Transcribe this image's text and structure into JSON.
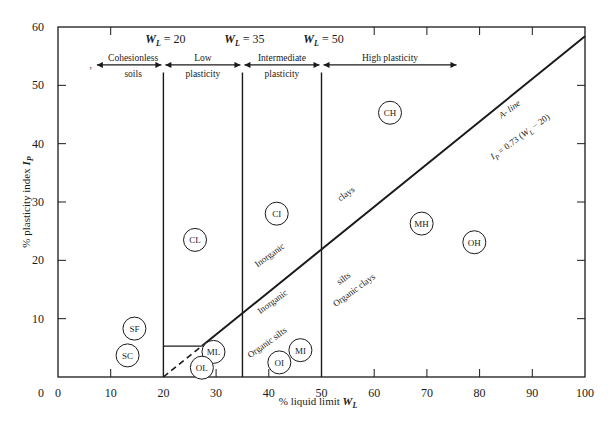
{
  "chart_data": {
    "type": "line",
    "xlabel": "% liquid limit W_L",
    "ylabel": "% plasticity index I_P",
    "xlim": [
      0,
      100
    ],
    "ylim": [
      0,
      60
    ],
    "grid": false,
    "x_ticks": [
      0,
      10,
      20,
      30,
      40,
      50,
      60,
      70,
      80,
      90,
      100
    ],
    "y_ticks": [
      0,
      10,
      20,
      30,
      40,
      50,
      60
    ],
    "a_line": {
      "name": "A- line",
      "equation": "I_P = 0.73 (W_L − 20)",
      "points": [
        [
          20,
          0
        ],
        [
          100,
          58.4
        ]
      ],
      "dashed_segment": [
        [
          20,
          0
        ],
        [
          27.3,
          5.3
        ]
      ]
    },
    "lower_boundary": {
      "points": [
        [
          20,
          5.3
        ],
        [
          27.3,
          5.3
        ]
      ]
    },
    "vertical_boundaries": [
      {
        "x": 20,
        "label": "W_L = 20"
      },
      {
        "x": 35,
        "label": "W_L = 35"
      },
      {
        "x": 50,
        "label": "W_L = 50"
      }
    ],
    "regions": [
      {
        "label_line1": "Cohesionless",
        "label_line2": "soils",
        "x_from": 7,
        "x_to": 20
      },
      {
        "label_line1": "Low",
        "label_line2": "plasticity",
        "x_from": 20,
        "x_to": 35
      },
      {
        "label_line1": "Intermediate",
        "label_line2": "plasticity",
        "x_from": 35,
        "x_to": 50
      },
      {
        "label_line1": "High plasticity",
        "label_line2": "",
        "x_from": 50,
        "x_to": 76
      }
    ],
    "soil_groups": [
      {
        "label": "SF",
        "x": 14.5,
        "y": 8.3
      },
      {
        "label": "SC",
        "x": 13.2,
        "y": 3.7
      },
      {
        "label": "CL",
        "x": 26,
        "y": 23.5
      },
      {
        "label": "ML",
        "x": 29.5,
        "y": 4.3
      },
      {
        "label": "OL",
        "x": 27.3,
        "y": 1.6
      },
      {
        "label": "CI",
        "x": 41.5,
        "y": 28
      },
      {
        "label": "MI",
        "x": 46,
        "y": 4.6
      },
      {
        "label": "OI",
        "x": 42,
        "y": 2.5
      },
      {
        "label": "CH",
        "x": 63,
        "y": 45.3
      },
      {
        "label": "MH",
        "x": 69,
        "y": 26.3
      },
      {
        "label": "OH",
        "x": 79,
        "y": 23.1
      }
    ],
    "annotations": [
      {
        "text": "Inorganic",
        "x": 40.5,
        "y": 20.5,
        "angle": -36
      },
      {
        "text": "clays",
        "x": 55,
        "y": 31,
        "angle": -36
      },
      {
        "text": "Inorganic",
        "x": 41,
        "y": 12.5,
        "angle": -36
      },
      {
        "text": "silts",
        "x": 54.5,
        "y": 16.5,
        "angle": -36
      },
      {
        "text": "Organic silts",
        "x": 40,
        "y": 5.5,
        "angle": -36
      },
      {
        "text": "Organic clays",
        "x": 56.5,
        "y": 14.5,
        "angle": -36
      },
      {
        "text": "A- line",
        "x": 86,
        "y": 45.5,
        "angle": -36
      },
      {
        "text": "I_P = 0.73 (W_L − 20)",
        "x": 88,
        "y": 40.8,
        "angle": -36
      }
    ]
  },
  "axes": {
    "x_title_prefix": "% liquid limit ",
    "x_title_var": "W",
    "x_title_sub": "L",
    "y_title_prefix": "% plasticity index ",
    "y_title_var": "I",
    "y_title_sub": "P"
  },
  "wl_labels": [
    {
      "var": "W",
      "sub": "L",
      "rest": " = 20"
    },
    {
      "var": "W",
      "sub": "L",
      "rest": " = 35"
    },
    {
      "var": "W",
      "sub": "L",
      "rest": " = 50"
    }
  ],
  "a_line_text": {
    "name": "A- line",
    "eq_var": "I",
    "eq_sub": "P",
    "eq_mid": " = 0.73 (",
    "eq_var2": "W",
    "eq_sub2": "L",
    "eq_end": " − 20)"
  }
}
